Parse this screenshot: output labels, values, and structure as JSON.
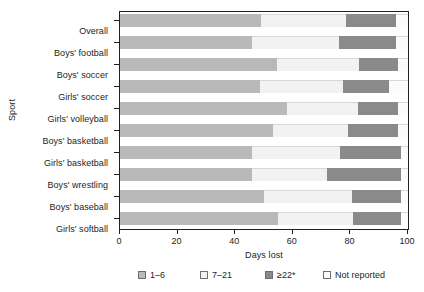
{
  "chart_data": {
    "type": "bar",
    "orientation": "horizontal",
    "stacked": true,
    "title": "",
    "xlabel": "Days lost",
    "ylabel": "Sport",
    "xlim": [
      0,
      100
    ],
    "xticks": [
      0,
      20,
      40,
      60,
      80,
      100
    ],
    "xtick_labels": [
      "0",
      "20",
      "40",
      "60",
      "80",
      "100"
    ],
    "grid": false,
    "legend_position": "bottom",
    "categories": [
      "Overall",
      "Boys' football",
      "Boys' soccer",
      "Girls' soccer",
      "Girls' volleyball",
      "Boys' basketball",
      "Girls' basketball",
      "Boys' wrestling",
      "Boys' baseball",
      "Girls' softball"
    ],
    "series": [
      {
        "name": "1–6",
        "color": "#b9b9b9",
        "values": [
          49.0,
          46.0,
          54.5,
          48.5,
          58.0,
          53.0,
          46.0,
          46.0,
          50.0,
          55.0
        ]
      },
      {
        "name": "7–21",
        "color": "#f2f2f2",
        "values": [
          29.5,
          30.0,
          28.5,
          29.0,
          24.5,
          26.0,
          30.5,
          26.0,
          30.5,
          26.0
        ]
      },
      {
        "name": "≥22*",
        "color": "#8a8a8a",
        "values": [
          17.5,
          20.0,
          13.5,
          16.0,
          14.0,
          17.5,
          21.0,
          25.5,
          17.0,
          16.5
        ]
      },
      {
        "name": "Not reported",
        "color": "#fbfbfb",
        "values": [
          4.0,
          4.0,
          3.5,
          6.5,
          3.5,
          3.5,
          2.5,
          2.5,
          2.5,
          2.5
        ]
      }
    ],
    "legend": [
      {
        "label": "1–6",
        "color": "#b9b9b9"
      },
      {
        "label": "7–21",
        "color": "#f2f2f2"
      },
      {
        "label": "≥22*",
        "color": "#8a8a8a"
      },
      {
        "label": "Not reported",
        "color": "#fbfbfb"
      }
    ]
  }
}
